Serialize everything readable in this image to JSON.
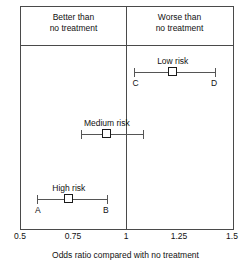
{
  "chart_data": {
    "type": "scatter",
    "title": "",
    "xlabel": "Odds ratio compared with no treatment",
    "ylabel": "",
    "xlim": [
      0.5,
      1.5
    ],
    "xticks": [
      0.5,
      0.75,
      1.0,
      1.25,
      1.5
    ],
    "xtick_labels": [
      "0.5",
      "0.75",
      "1",
      "1.25",
      "1.5"
    ],
    "grid": false,
    "legend": "none",
    "reference_line": 1.0,
    "band_labels": [
      "Better than no treatment",
      "Worse than no treatment"
    ],
    "series": [
      {
        "name": "Low risk",
        "estimate": 1.22,
        "ci_low": 1.04,
        "ci_high": 1.42,
        "ci_low_label": "C",
        "ci_high_label": "D"
      },
      {
        "name": "Medium risk",
        "estimate": 0.91,
        "ci_low": 0.79,
        "ci_high": 1.08,
        "ci_low_label": "",
        "ci_high_label": ""
      },
      {
        "name": "High risk",
        "estimate": 0.73,
        "ci_low": 0.58,
        "ci_high": 0.91,
        "ci_low_label": "A",
        "ci_high_label": "B"
      }
    ]
  },
  "header": {
    "better_line1": "Better than",
    "better_line2": "no treatment",
    "worse_line1": "Worse than",
    "worse_line2": "no treatment"
  },
  "studies": {
    "low": {
      "label": "Low risk",
      "left_cap_label": "C",
      "right_cap_label": "D"
    },
    "medium": {
      "label": "Medium risk",
      "left_cap_label": "",
      "right_cap_label": ""
    },
    "high": {
      "label": "High risk",
      "left_cap_label": "A",
      "right_cap_label": "B"
    }
  },
  "axis": {
    "tick_0": "0.5",
    "tick_1": "0.75",
    "tick_2": "1",
    "tick_3": "1.25",
    "tick_4": "1.5",
    "title": "Odds ratio compared with no treatment"
  }
}
